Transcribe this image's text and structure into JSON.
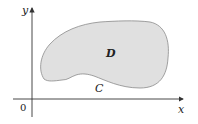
{
  "figure": {
    "axes": {
      "x_label": "x",
      "y_label": "y",
      "origin_label": "0"
    },
    "region": {
      "label": "D",
      "fill": "#e0e0e0",
      "stroke": "#888888"
    },
    "boundary": {
      "label": "C"
    }
  }
}
